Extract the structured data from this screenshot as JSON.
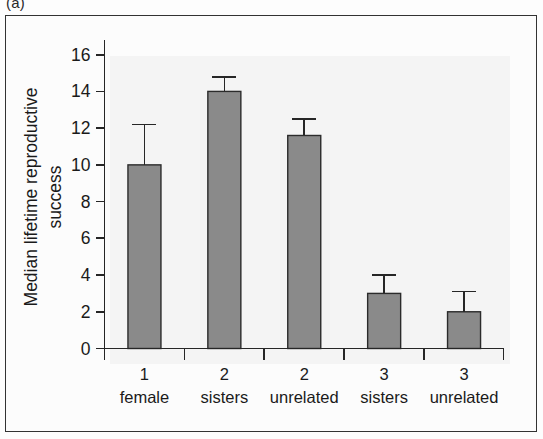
{
  "figure": {
    "panel_label": "(a)"
  },
  "chart_data": {
    "type": "bar",
    "title": "",
    "subtitle": "",
    "xlabel": "",
    "ylabel_line1": "Median lifetime reproductive",
    "ylabel_line2": "success",
    "categories": [
      {
        "line1": "1",
        "line2": "female"
      },
      {
        "line1": "2",
        "line2": "sisters"
      },
      {
        "line1": "2",
        "line2": "unrelated"
      },
      {
        "line1": "3",
        "line2": "sisters"
      },
      {
        "line1": "3",
        "line2": "unrelated"
      }
    ],
    "category_labels": [
      "1 female",
      "2 sisters",
      "2 unrelated",
      "3 sisters",
      "3 unrelated"
    ],
    "values": [
      10.0,
      14.0,
      11.6,
      3.0,
      2.0
    ],
    "errors_upper": [
      2.2,
      0.8,
      0.9,
      1.0,
      1.1
    ],
    "errors_lower": [
      0,
      0,
      0,
      0,
      0
    ],
    "error_type": "upper-only",
    "ylim": [
      0,
      16.8
    ],
    "yticks": [
      0,
      2,
      4,
      6,
      8,
      10,
      12,
      14,
      16
    ],
    "ytick_labels": [
      "0",
      "2",
      "4",
      "6",
      "8",
      "10",
      "12",
      "14",
      "16"
    ],
    "grid": false,
    "legend": null,
    "legend_position": "none",
    "bar_color": "#8a8a8a",
    "bar_edge_color": "#2b2b2b",
    "axis_color": "#262626",
    "plot_background": "#f4f4f4"
  }
}
